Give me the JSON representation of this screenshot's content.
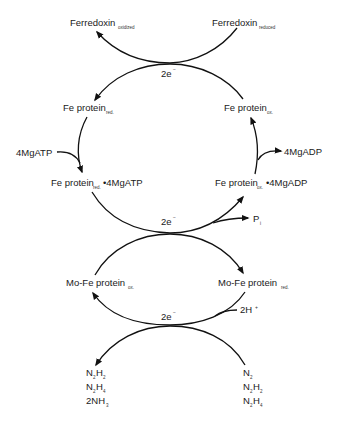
{
  "diagram": {
    "colors": {
      "line": "#111111",
      "text": "#1a1a1a",
      "background": "#ffffff"
    },
    "ferredoxin": {
      "oxidized": {
        "main": "Ferredoxin",
        "sub": "oxidized"
      },
      "reduced": {
        "main": "Ferredoxin",
        "sub": "reduced"
      }
    },
    "electrons": {
      "top": {
        "main": "2e",
        "sup": "−"
      },
      "middle": {
        "main": "2e",
        "sup": "−"
      },
      "bottom": {
        "main": "2e",
        "sup": "−"
      }
    },
    "fe_protein": {
      "red": {
        "main": "Fe protein",
        "sub": "red."
      },
      "ox": {
        "main": "Fe protein",
        "sub": "ox."
      },
      "red_atp": {
        "main": "Fe protein",
        "sub": "red.",
        "suffix": "•4MgATP"
      },
      "ox_adp": {
        "main": "Fe protein",
        "sub": "ox.",
        "suffix": "•4MgADP"
      }
    },
    "cofactors": {
      "atp_in": "4MgATP",
      "adp_out": "4MgADP",
      "pi": {
        "main": "P",
        "sub": "i"
      },
      "protons": {
        "main": "2H",
        "sup": "+"
      }
    },
    "mofe_protein": {
      "ox": {
        "main": "Mo-Fe protein",
        "sub": "ox."
      },
      "red": {
        "main": "Mo-Fe protein",
        "sub": "red."
      }
    },
    "products": [
      {
        "parts": [
          "N",
          "2",
          "H",
          "2"
        ]
      },
      {
        "parts": [
          "N",
          "2",
          "H",
          "4"
        ]
      },
      {
        "parts": [
          "2NH",
          "3"
        ]
      }
    ],
    "substrates": [
      {
        "parts": [
          "N",
          "2"
        ]
      },
      {
        "parts": [
          "N",
          "2",
          "H",
          "2"
        ]
      },
      {
        "parts": [
          "N",
          "2",
          "H",
          "4"
        ]
      }
    ]
  }
}
